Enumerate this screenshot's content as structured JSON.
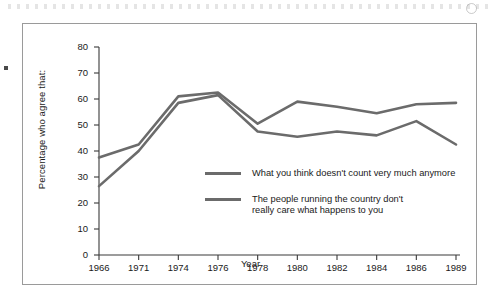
{
  "chart_data": {
    "type": "line",
    "title": "",
    "xlabel": "Year",
    "ylabel": "Percentage who agree that:",
    "categories": [
      "1966",
      "1971",
      "1974",
      "1976",
      "1978",
      "1980",
      "1982",
      "1984",
      "1986",
      "1989"
    ],
    "x": [
      1966,
      1971,
      1974,
      1976,
      1978,
      1980,
      1982,
      1984,
      1986,
      1989
    ],
    "ylim": [
      0,
      80
    ],
    "ytick_labels": [
      "0",
      "10",
      "20",
      "30",
      "40",
      "50",
      "60",
      "70",
      "80"
    ],
    "yticks": [
      0,
      10,
      20,
      30,
      40,
      50,
      60,
      70,
      80
    ],
    "grid": false,
    "legend_position": "inside-center",
    "series": [
      {
        "name": "What you think doesn't count very much anymore",
        "color": "#6b6b6b",
        "values": [
          37.5,
          42.5,
          61.0,
          62.5,
          50.5,
          59.0,
          57.0,
          54.5,
          58.0,
          58.5
        ]
      },
      {
        "name": "The people running the country don't\nreally care what happens to you",
        "color": "#6b6b6b",
        "values": [
          26.5,
          40.0,
          58.5,
          61.5,
          47.5,
          45.5,
          47.5,
          46.0,
          51.5,
          42.5
        ]
      }
    ]
  },
  "legend": {
    "items": [
      {
        "label": "What you think doesn't count very much anymore"
      },
      {
        "label": "The people running the country don't\nreally care what happens to you"
      }
    ]
  },
  "colors": {
    "line": "#6b6b6b",
    "axis": "#3a3a3a",
    "frame": "#9a9a9a",
    "text": "#1a1a1a"
  }
}
